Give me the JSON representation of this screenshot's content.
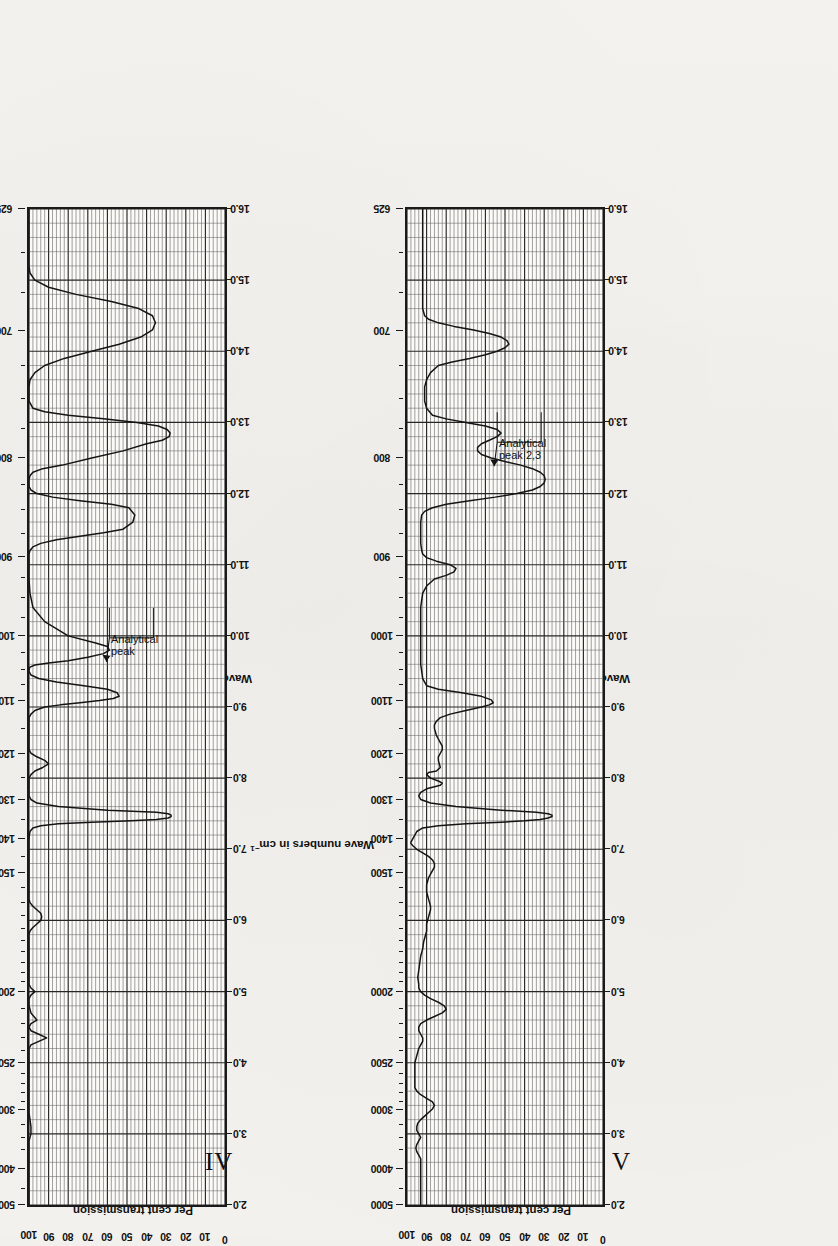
{
  "page": {
    "background": "#f2f0ec",
    "ink": "#111111"
  },
  "axes": {
    "wavenumber_title_pre": "Wave numbers in cm",
    "wavenumber_title_sup": "−1",
    "wavelength_title": "Wavelength in microns",
    "transmission_title": "Per cent transmission",
    "wavenumber_ticks": [
      "5000",
      "4000",
      "3000",
      "2500",
      "2000",
      "1500",
      "1400",
      "1300",
      "1200",
      "1100",
      "1000",
      "900",
      "800",
      "700",
      "625"
    ],
    "wavelength_ticks": [
      "2.0",
      "3.0",
      "4.0",
      "5.0",
      "6.0",
      "7.0",
      "8.0",
      "9.0",
      "10.0",
      "11.0",
      "12.0",
      "13.0",
      "14.0",
      "15.0",
      "16.0"
    ],
    "transmission_ticks": [
      "100",
      "90",
      "80",
      "70",
      "60",
      "50",
      "40",
      "30",
      "20",
      "10",
      "0"
    ]
  },
  "figures": [
    {
      "id": "IV",
      "label": "IV",
      "annotation": {
        "line1": "Analytical",
        "line2": "peak",
        "x_micron": 9.55,
        "y_percent": 60
      }
    },
    {
      "id": "V",
      "label": "V",
      "annotation": {
        "line1": "Analytical",
        "line2": "peak 2,3",
        "x_micron": 12.3,
        "y_percent": 55
      }
    }
  ],
  "chart_data": [
    {
      "type": "line",
      "id": "IV",
      "title": "IV",
      "xlabel": "Wavelength in microns",
      "ylabel": "Per cent transmission",
      "x2label": "Wave numbers in cm−1",
      "xlim": [
        2.0,
        16.0
      ],
      "ylim": [
        0,
        100
      ],
      "grid": true,
      "legend": "none",
      "annotations": [
        {
          "text": "Analytical peak",
          "x": 9.55,
          "y": 60
        }
      ],
      "series": [
        {
          "name": "spectrum IV",
          "x": [
            2.0,
            2.2,
            2.4,
            2.6,
            2.7,
            2.8,
            2.9,
            2.95,
            3.0,
            3.05,
            3.1,
            3.2,
            3.3,
            3.35,
            3.4,
            3.45,
            3.5,
            3.6,
            3.7,
            3.8,
            3.9,
            4.0,
            4.1,
            4.2,
            4.25,
            4.3,
            4.35,
            4.4,
            4.45,
            4.5,
            4.55,
            4.6,
            4.7,
            4.8,
            4.9,
            4.95,
            5.0,
            5.05,
            5.1,
            5.2,
            5.3,
            5.4,
            5.5,
            5.6,
            5.7,
            5.75,
            5.8,
            5.85,
            5.9,
            5.95,
            6.0,
            6.05,
            6.1,
            6.15,
            6.2,
            6.25,
            6.3,
            6.4,
            6.5,
            6.6,
            6.7,
            6.8,
            6.9,
            6.95,
            7.0,
            7.05,
            7.1,
            7.15,
            7.2,
            7.25,
            7.3,
            7.33,
            7.36,
            7.38,
            7.4,
            7.42,
            7.44,
            7.46,
            7.48,
            7.5,
            7.52,
            7.55,
            7.6,
            7.65,
            7.7,
            7.75,
            7.8,
            7.85,
            7.9,
            7.95,
            8.0,
            8.05,
            8.1,
            8.15,
            8.2,
            8.25,
            8.3,
            8.35,
            8.4,
            8.5,
            8.6,
            8.7,
            8.75,
            8.8,
            8.85,
            8.9,
            8.95,
            9.0,
            9.03,
            9.06,
            9.09,
            9.12,
            9.15,
            9.2,
            9.25,
            9.3,
            9.35,
            9.4,
            9.45,
            9.5,
            9.53,
            9.56,
            9.59,
            9.62,
            9.65,
            9.7,
            9.75,
            9.8,
            9.85,
            9.9,
            10.0,
            10.2,
            10.4,
            10.6,
            10.8,
            10.9,
            11.0,
            11.05,
            11.1,
            11.15,
            11.2,
            11.25,
            11.3,
            11.35,
            11.4,
            11.45,
            11.5,
            11.6,
            11.7,
            11.8,
            11.85,
            11.9,
            11.95,
            12.0,
            12.05,
            12.1,
            12.15,
            12.2,
            12.25,
            12.3,
            12.35,
            12.4,
            12.5,
            12.6,
            12.7,
            12.75,
            12.8,
            12.85,
            12.9,
            12.95,
            13.0,
            13.05,
            13.1,
            13.15,
            13.2,
            13.3,
            13.4,
            13.5,
            13.6,
            13.7,
            13.8,
            13.9,
            14.0,
            14.1,
            14.2,
            14.3,
            14.4,
            14.5,
            14.6,
            14.7,
            14.8,
            14.9,
            15.0,
            15.1,
            15.2,
            15.3,
            15.4,
            15.5,
            15.6,
            15.7,
            15.8,
            15.9,
            16.0
          ],
          "y": [
            100,
            100,
            100,
            100,
            100,
            100,
            100,
            99.5,
            99,
            99,
            99,
            99.5,
            100,
            100,
            100,
            100,
            100,
            100,
            100,
            100,
            100,
            100,
            100,
            100,
            99,
            95,
            91,
            95,
            99,
            100,
            99,
            96,
            99,
            100,
            100,
            99,
            97,
            99,
            100,
            100,
            100,
            100,
            100,
            100,
            100,
            100,
            100,
            99.5,
            98,
            96,
            94,
            93.5,
            94,
            96,
            98,
            99.5,
            100,
            100,
            100,
            100,
            100,
            100,
            100,
            100,
            100,
            100,
            100,
            100,
            99.8,
            99.5,
            98,
            94,
            85,
            68,
            48,
            35,
            29,
            27.5,
            27.5,
            29,
            35,
            60,
            85,
            96,
            99,
            100,
            100,
            100,
            100,
            100,
            100,
            99,
            97,
            93,
            90,
            92,
            96,
            99,
            100,
            100,
            100,
            100,
            100,
            100,
            100,
            99,
            97,
            92,
            84,
            74,
            64,
            57,
            54,
            55,
            60,
            72,
            86,
            95,
            99,
            100,
            100,
            99.5,
            97,
            90,
            80,
            70,
            62,
            59,
            60,
            66,
            80,
            92,
            98,
            99.5,
            100,
            100,
            100,
            100,
            100,
            100,
            99.5,
            98,
            94,
            86,
            74,
            62,
            52,
            47,
            46,
            49,
            58,
            74,
            88,
            96,
            99,
            100,
            100,
            100,
            99.5,
            98,
            93,
            83,
            68,
            52,
            40,
            32,
            28.5,
            28,
            29.5,
            34,
            45,
            62,
            80,
            92,
            98,
            100,
            100,
            100,
            99.5,
            97,
            92,
            82,
            68,
            54,
            43,
            37,
            35.5,
            37,
            44,
            58,
            76,
            90,
            97,
            99.5,
            100,
            100,
            100,
            100,
            100,
            100,
            100,
            100,
            100,
            99.5,
            99,
            98.5,
            98,
            97.5,
            97,
            97,
            97.5,
            98,
            98,
            97.5,
            97,
            96,
            95,
            94,
            93,
            92
          ]
        }
      ]
    },
    {
      "type": "line",
      "id": "V",
      "title": "V",
      "xlabel": "Wavelength in microns",
      "ylabel": "Per cent transmission",
      "x2label": "Wave numbers in cm−1",
      "xlim": [
        2.0,
        16.0
      ],
      "ylim": [
        0,
        100
      ],
      "grid": true,
      "legend": "none",
      "annotations": [
        {
          "text": "Analytical peak 2,3",
          "x": 12.3,
          "y": 55
        }
      ],
      "series": [
        {
          "name": "spectrum V",
          "x": [
            2.0,
            2.1,
            2.2,
            2.3,
            2.4,
            2.5,
            2.6,
            2.65,
            2.7,
            2.75,
            2.8,
            2.85,
            2.9,
            2.95,
            3.0,
            3.05,
            3.1,
            3.15,
            3.2,
            3.25,
            3.3,
            3.35,
            3.4,
            3.45,
            3.5,
            3.55,
            3.6,
            3.65,
            3.7,
            3.8,
            3.9,
            4.0,
            4.1,
            4.2,
            4.25,
            4.3,
            4.35,
            4.4,
            4.45,
            4.5,
            4.55,
            4.6,
            4.65,
            4.7,
            4.75,
            4.8,
            4.85,
            4.9,
            4.95,
            5.0,
            5.05,
            5.1,
            5.2,
            5.3,
            5.4,
            5.5,
            5.6,
            5.7,
            5.75,
            5.8,
            5.85,
            5.9,
            5.95,
            6.0,
            6.05,
            6.1,
            6.15,
            6.2,
            6.25,
            6.3,
            6.35,
            6.4,
            6.5,
            6.6,
            6.65,
            6.7,
            6.75,
            6.8,
            6.85,
            6.9,
            6.95,
            7.0,
            7.05,
            7.08,
            7.1,
            7.15,
            7.2,
            7.25,
            7.3,
            7.33,
            7.36,
            7.38,
            7.4,
            7.42,
            7.44,
            7.46,
            7.48,
            7.5,
            7.52,
            7.55,
            7.6,
            7.65,
            7.7,
            7.75,
            7.8,
            7.85,
            7.88,
            7.9,
            7.93,
            7.96,
            8.0,
            8.05,
            8.08,
            8.1,
            8.15,
            8.2,
            8.25,
            8.3,
            8.35,
            8.4,
            8.45,
            8.5,
            8.55,
            8.6,
            8.65,
            8.7,
            8.75,
            8.8,
            8.85,
            8.9,
            8.95,
            9.0,
            9.03,
            9.06,
            9.1,
            9.15,
            9.2,
            9.25,
            9.3,
            9.4,
            9.5,
            9.6,
            9.7,
            9.8,
            9.9,
            10.0,
            10.2,
            10.4,
            10.6,
            10.7,
            10.8,
            10.85,
            10.9,
            10.95,
            11.0,
            11.05,
            11.1,
            11.15,
            11.2,
            11.3,
            11.4,
            11.5,
            11.6,
            11.7,
            11.75,
            11.8,
            11.85,
            11.9,
            11.95,
            12.0,
            12.05,
            12.1,
            12.15,
            12.2,
            12.25,
            12.3,
            12.35,
            12.4,
            12.45,
            12.5,
            12.55,
            12.6,
            12.65,
            12.7,
            12.75,
            12.8,
            12.85,
            12.9,
            12.95,
            13.0,
            13.05,
            13.1,
            13.2,
            13.3,
            13.4,
            13.5,
            13.6,
            13.7,
            13.8,
            13.85,
            13.9,
            13.95,
            14.0,
            14.05,
            14.1,
            14.15,
            14.2,
            14.25,
            14.3,
            14.35,
            14.4,
            14.45,
            14.5,
            14.6,
            14.7,
            14.8,
            14.9,
            15.0,
            15.1,
            15.2,
            15.3,
            15.4,
            15.5,
            15.6,
            15.7,
            15.8,
            15.9,
            16.0
          ],
          "y": [
            93,
            93,
            93,
            93,
            93,
            93,
            93,
            93,
            94,
            95,
            95.5,
            95,
            94,
            93,
            94,
            95,
            95,
            94.5,
            93,
            91,
            89,
            87,
            86,
            87,
            90,
            93,
            95,
            96,
            96,
            96,
            96,
            96,
            95,
            94,
            93,
            92,
            92,
            93,
            94,
            94,
            93,
            90,
            86,
            82,
            80,
            81,
            84,
            88,
            91,
            93,
            94,
            94,
            94.5,
            94,
            93.5,
            93,
            92,
            91.5,
            91,
            90.5,
            90,
            90,
            90,
            89.5,
            89,
            88.5,
            88,
            88,
            88.5,
            89,
            89.5,
            90,
            90,
            89,
            88,
            87,
            86,
            86,
            87,
            89,
            92,
            95,
            97,
            98,
            98,
            97,
            96,
            95,
            92,
            84,
            70,
            52,
            40,
            32,
            28,
            26,
            26,
            28,
            34,
            52,
            75,
            88,
            93,
            94,
            93,
            90,
            86,
            83,
            82,
            84,
            88,
            90,
            89,
            85,
            83,
            83.5,
            84,
            84,
            83,
            82,
            82,
            83,
            84,
            85,
            85.5,
            86,
            86,
            85,
            83,
            78,
            70,
            62,
            58,
            56,
            57,
            62,
            72,
            84,
            90,
            92,
            92.5,
            93,
            93,
            93,
            93,
            93,
            93,
            93,
            92,
            90,
            86,
            80,
            76,
            75,
            78,
            85,
            90,
            92,
            92.5,
            93,
            93,
            93,
            93,
            92.5,
            91,
            87,
            80,
            68,
            55,
            44,
            36,
            32,
            30,
            29.5,
            30,
            32,
            36,
            42,
            50,
            57,
            62,
            64,
            64,
            62,
            58,
            54,
            52,
            54,
            60,
            70,
            80,
            87,
            90,
            91,
            91,
            91,
            90,
            88,
            84,
            77,
            68,
            60,
            54,
            50,
            48,
            49,
            52,
            58,
            66,
            76,
            84,
            89,
            91,
            92,
            92,
            92,
            92,
            92,
            92,
            92,
            92,
            92,
            92,
            92,
            92,
            92,
            92,
            92,
            92
          ]
        }
      ]
    }
  ]
}
